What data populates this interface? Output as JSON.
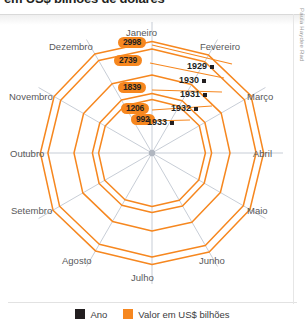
{
  "headline": {
    "text": "em US$ bilhões de dolares"
  },
  "credit": {
    "text": "Paula Haydee Rad"
  },
  "chart_data": {
    "type": "radar",
    "title": "",
    "categories": [
      "Janeiro",
      "Fevereiro",
      "Março",
      "Abril",
      "Maio",
      "Junho",
      "Julho",
      "Agosto",
      "Setembro",
      "Outubro",
      "Novembro",
      "Dezembro"
    ],
    "series": [
      {
        "name": "1929",
        "value": 2998,
        "value_label": "2998"
      },
      {
        "name": "1930",
        "value": 2739,
        "value_label": "2739"
      },
      {
        "name": "1931",
        "value": 1839,
        "value_label": "1839"
      },
      {
        "name": "1932",
        "value": 1206,
        "value_label": "1206"
      },
      {
        "name": "1933",
        "value": 992,
        "value_label": "992"
      }
    ],
    "unit": "US$ bilhões",
    "grid": true,
    "legend_position": "bottom",
    "colors": {
      "value": "#f6871f",
      "year": "#231f20",
      "spoke": "#b9c0cb"
    }
  },
  "axis_labels": {
    "janeiro": "Janeiro",
    "fevereiro": "Fevereiro",
    "marco": "Março",
    "abril": "Abril",
    "maio": "Maio",
    "junho": "Junho",
    "julho": "Julho",
    "agosto": "Agosto",
    "setembro": "Setembro",
    "outubro": "Outubro",
    "novembro": "Novembro",
    "dezembro": "Dezembro"
  },
  "value_pills": {
    "p1": "2998",
    "p2": "2739",
    "p3": "1839",
    "p4": "1206",
    "p5": "992"
  },
  "year_labels": {
    "y1": "1929",
    "y2": "1930",
    "y3": "1931",
    "y4": "1932",
    "y5": "1933"
  },
  "legend": {
    "ano": "Ano",
    "valor": "Valor em US$ bilhões"
  }
}
